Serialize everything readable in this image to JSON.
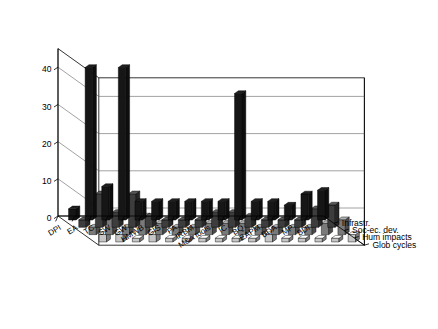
{
  "chart": {
    "type": "3d-bar",
    "title": "",
    "background_color": "#ffffff"
  },
  "axes": {
    "y": {
      "label": "",
      "ticks": [
        "0",
        "10",
        "20",
        "30",
        "40"
      ],
      "values": [
        0,
        10,
        20,
        30,
        40
      ],
      "min": 0,
      "max": 45
    },
    "x": {
      "label": "",
      "categories": [
        "DPI",
        "EA",
        "TC",
        "SW",
        "GW",
        "HMWB",
        "GIS",
        "PA",
        "IRBM",
        "M&A tools",
        "IC",
        "BQ",
        "EAPM",
        "BDA",
        "MP",
        "BDI"
      ]
    },
    "z": {
      "label": "",
      "categories": [
        "Glob cycles",
        "Hum impacts",
        "Soc-ec. dev.",
        "Infrastr."
      ]
    }
  },
  "legend": {
    "position": "right",
    "entries": [
      {
        "label": "Glob cycles",
        "color": "#161616"
      },
      {
        "label": "Hum impacts",
        "color": "#3d3d3d"
      },
      {
        "label": "Soc-ec. dev.",
        "color": "#7a7a7a"
      },
      {
        "label": "Infrastr.",
        "color": "#c6c6c6"
      }
    ]
  },
  "chart_data": {
    "type": "bar",
    "title": "",
    "xlabel": "",
    "ylabel": "",
    "ylim": [
      0,
      45
    ],
    "grid": true,
    "legend_position": "right",
    "categories": [
      "DPI",
      "EA",
      "TC",
      "SW",
      "GW",
      "HMWB",
      "GIS",
      "PA",
      "IRBM",
      "M&A tools",
      "IC",
      "BQ",
      "EAPM",
      "BDA",
      "MP",
      "BDI"
    ],
    "series": [
      {
        "name": "Glob cycles",
        "color": "#161616",
        "values": [
          3,
          41,
          9,
          41,
          5,
          5,
          5,
          5,
          5,
          5,
          34,
          5,
          5,
          4,
          7,
          8
        ]
      },
      {
        "name": "Hum impacts",
        "color": "#3d3d3d",
        "values": [
          2,
          9,
          4,
          9,
          3,
          2,
          2,
          2,
          4,
          4,
          3,
          2,
          2,
          2,
          5,
          6
        ]
      },
      {
        "name": "Soc-ec. dev.",
        "color": "#7a7a7a",
        "values": [
          2,
          5,
          2,
          5,
          3,
          2,
          2,
          3,
          3,
          3,
          2,
          2,
          2,
          2,
          3,
          4
        ]
      },
      {
        "name": "Infrastr.",
        "color": "#c6c6c6",
        "values": [
          2,
          2,
          1,
          2,
          1,
          1,
          1,
          1,
          1,
          1,
          2,
          1,
          1,
          1,
          1,
          2
        ]
      }
    ]
  }
}
